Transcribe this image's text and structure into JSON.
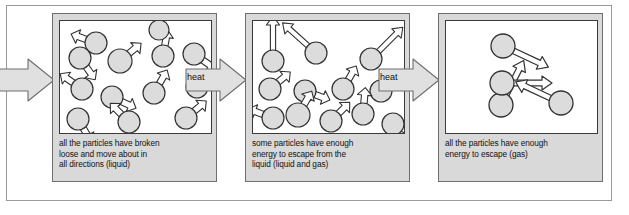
{
  "diagram": {
    "type": "process-flow",
    "panels": [
      {
        "id": "liquid",
        "caption": "all the particles have broken\nloose and move about in\nall directions (liquid)",
        "state": "liquid",
        "particle_count": 13,
        "particles": [
          {
            "cx": 36,
            "cy": 22,
            "r": 11,
            "arrow": "short",
            "angle": 200
          },
          {
            "cx": 20,
            "cy": 37,
            "r": 11,
            "arrow": "short",
            "angle": 55
          },
          {
            "cx": 60,
            "cy": 40,
            "r": 12,
            "arrow": "short",
            "angle": 320
          },
          {
            "cx": 103,
            "cy": 35,
            "r": 11,
            "arrow": "short",
            "angle": 280
          },
          {
            "cx": 134,
            "cy": 33,
            "r": 11,
            "arrow": "short",
            "angle": 35
          },
          {
            "cx": 22,
            "cy": 68,
            "r": 11,
            "arrow": "short",
            "angle": 215
          },
          {
            "cx": 137,
            "cy": 66,
            "r": 11,
            "arrow": "short",
            "angle": 330
          },
          {
            "cx": 52,
            "cy": 76,
            "r": 11,
            "arrow": "short",
            "angle": 25
          },
          {
            "cx": 94,
            "cy": 72,
            "r": 11,
            "arrow": "short",
            "angle": 300
          },
          {
            "cx": 18,
            "cy": 98,
            "r": 11,
            "arrow": "short",
            "angle": 60
          },
          {
            "cx": 69,
            "cy": 101,
            "r": 11,
            "arrow": "short",
            "angle": 225
          },
          {
            "cx": 126,
            "cy": 97,
            "r": 11,
            "arrow": "short",
            "angle": 320
          },
          {
            "cx": 99,
            "cy": 9,
            "r": 9,
            "arrow": "none",
            "angle": 0
          }
        ]
      },
      {
        "id": "mixed",
        "caption": "some particles have enough\nenergy to escape from the\nliquid (liquid and gas)",
        "state": "liquid and gas",
        "particle_count": 12,
        "particles": [
          {
            "cx": 20,
            "cy": 40,
            "r": 11,
            "arrow": "long",
            "angle": 270
          },
          {
            "cx": 63,
            "cy": 32,
            "r": 11,
            "arrow": "long",
            "angle": 222
          },
          {
            "cx": 118,
            "cy": 38,
            "r": 11,
            "arrow": "long",
            "angle": 315
          },
          {
            "cx": 17,
            "cy": 68,
            "r": 11,
            "arrow": "short",
            "angle": 320
          },
          {
            "cx": 52,
            "cy": 70,
            "r": 11,
            "arrow": "short",
            "angle": 20
          },
          {
            "cx": 90,
            "cy": 68,
            "r": 11,
            "arrow": "short",
            "angle": 300
          },
          {
            "cx": 128,
            "cy": 70,
            "r": 11,
            "arrow": "short",
            "angle": 330
          },
          {
            "cx": 20,
            "cy": 97,
            "r": 11,
            "arrow": "short",
            "angle": 200
          },
          {
            "cx": 45,
            "cy": 94,
            "r": 12,
            "arrow": "short",
            "angle": 300
          },
          {
            "cx": 78,
            "cy": 100,
            "r": 11,
            "arrow": "short",
            "angle": 315
          },
          {
            "cx": 110,
            "cy": 93,
            "r": 11,
            "arrow": "short",
            "angle": 275
          },
          {
            "cx": 140,
            "cy": 103,
            "r": 11,
            "arrow": "short",
            "angle": 25
          }
        ]
      },
      {
        "id": "gas",
        "caption": "all the particles have enough\nenergy to escape (gas)",
        "state": "gas",
        "particle_count": 4,
        "particles": [
          {
            "cx": 57,
            "cy": 25,
            "r": 12,
            "arrow": "long",
            "angle": 25
          },
          {
            "cx": 55,
            "cy": 84,
            "r": 12,
            "arrow": "long",
            "angle": 297
          },
          {
            "cx": 56,
            "cy": 62,
            "r": 12,
            "arrow": "long",
            "angle": 0
          },
          {
            "cx": 115,
            "cy": 82,
            "r": 12,
            "arrow": "long",
            "angle": 205
          }
        ]
      }
    ],
    "transitions": [
      {
        "id": "heat-1",
        "label": "heat"
      },
      {
        "id": "heat-2",
        "label": "heat"
      }
    ],
    "entry_arrow": {
      "label": ""
    },
    "colors": {
      "panel_fill": "#d9d9d9",
      "particle_fill": "#dcdcdc",
      "particle_stroke": "#333333",
      "box_fill": "#ffffff",
      "arrow_fill": "#ffffff",
      "arrow_stroke": "#333333",
      "big_arrow_fill": "#e0e0e0",
      "big_arrow_stroke": "#6e6e6e",
      "text": "#111111"
    }
  }
}
